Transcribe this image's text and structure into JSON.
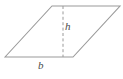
{
  "figure": {
    "type": "geometry-diagram",
    "shape": "parallelogram",
    "background_color": "#ffffff",
    "stroke_color": "#9a9a9a",
    "dash_color": "#9a9a9a",
    "label_color": "#4a4a4a",
    "labels": {
      "height": "h",
      "base": "b"
    },
    "geometry": {
      "outline_points": "5,57 52,6 120,6 73,57",
      "height_line": {
        "x1": 63,
        "y1": 6,
        "x2": 63,
        "y2": 57
      },
      "base_line": {
        "x1": 5,
        "y1": 57,
        "x2": 73,
        "y2": 57
      }
    }
  }
}
